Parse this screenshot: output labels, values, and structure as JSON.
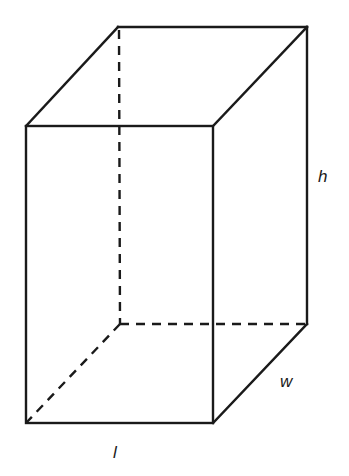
{
  "diagram": {
    "type": "rectangular-prism",
    "labels": {
      "height": "h",
      "width": "w",
      "length": "l"
    },
    "stroke_color": "#1a1a1a"
  }
}
